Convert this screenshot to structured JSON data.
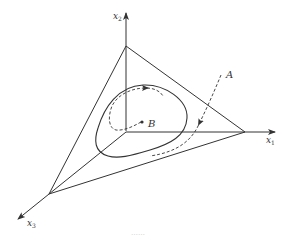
{
  "figure": {
    "type": "phase-space diagram on simplex",
    "axes": [
      {
        "name": "x1",
        "label_base": "x",
        "label_sub": "1",
        "direction": "right"
      },
      {
        "name": "x2",
        "label_base": "x",
        "label_sub": "2",
        "direction": "up"
      },
      {
        "name": "x3",
        "label_base": "x",
        "label_sub": "3",
        "direction": "down-left"
      }
    ],
    "points": [
      {
        "name": "B",
        "label": "B",
        "description": "interior fixed point"
      }
    ],
    "trajectories": [
      {
        "name": "A",
        "label": "A",
        "style": "dashed",
        "description": "trajectory entering simplex from outside, approaching closed orbit"
      },
      {
        "name": "inner-spiral",
        "style": "dashed",
        "description": "trajectory spiraling out from B toward closed orbit"
      }
    ],
    "closed_orbit": {
      "style": "solid",
      "description": "limit cycle"
    },
    "simplex": {
      "style": "solid",
      "description": "triangle with vertices on x1, x2, x3 axes"
    },
    "caption_fragment": "……"
  },
  "colors": {
    "line": "#333333",
    "background": "#ffffff"
  }
}
